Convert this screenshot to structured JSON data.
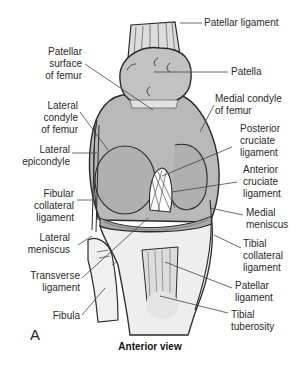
{
  "figure": {
    "panel_letter": "A",
    "caption": "Anterior view",
    "labels_left": [
      {
        "id": "patellar-surface-of-femur",
        "lines": [
          "Patellar",
          "surface",
          "of femur"
        ]
      },
      {
        "id": "lateral-condyle-of-femur",
        "lines": [
          "Lateral",
          "condyle",
          "of femur"
        ]
      },
      {
        "id": "lateral-epicondyle",
        "lines": [
          "Lateral",
          "epicondyle"
        ]
      },
      {
        "id": "fibular-collateral-ligament",
        "lines": [
          "Fibular",
          "collateral",
          "ligament"
        ]
      },
      {
        "id": "lateral-meniscus",
        "lines": [
          "Lateral",
          "meniscus"
        ]
      },
      {
        "id": "transverse-ligament",
        "lines": [
          "Transverse",
          "ligament"
        ]
      },
      {
        "id": "fibula",
        "lines": [
          "Fibula"
        ]
      }
    ],
    "labels_right": [
      {
        "id": "patellar-ligament-top",
        "lines": [
          "Patellar ligament"
        ]
      },
      {
        "id": "patella",
        "lines": [
          "Patella"
        ]
      },
      {
        "id": "medial-condyle-of-femur",
        "lines": [
          "Medial condyle",
          "of femur"
        ]
      },
      {
        "id": "posterior-cruciate-ligament",
        "lines": [
          "Posterior",
          "cruciate",
          "ligament"
        ]
      },
      {
        "id": "anterior-cruciate-ligament",
        "lines": [
          "Anterior",
          "cruciate",
          "ligament"
        ]
      },
      {
        "id": "medial-meniscus",
        "lines": [
          "Medial",
          "meniscus"
        ]
      },
      {
        "id": "tibial-collateral-ligament",
        "lines": [
          "Tibial",
          "collateral",
          "ligament"
        ]
      },
      {
        "id": "patellar-ligament-bottom",
        "lines": [
          "Patellar",
          "ligament"
        ]
      },
      {
        "id": "tibial-tuberosity",
        "lines": [
          "Tibial",
          "tuberosity"
        ]
      }
    ],
    "colors": {
      "bone_fill": "#b9b9b9",
      "bone_light": "#e6e6e6",
      "outline": "#2b2b2b",
      "leader": "#444444"
    }
  }
}
